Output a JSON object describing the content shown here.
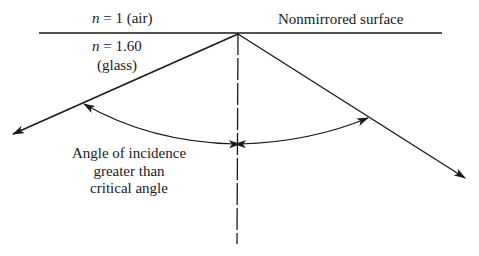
{
  "diagram": {
    "type": "total-internal-reflection",
    "labels": {
      "upper_medium_n": "n",
      "upper_medium_value": " = 1 (air)",
      "lower_medium_n": "n",
      "lower_medium_value": " = 1.60",
      "lower_medium_name": "(glass)",
      "surface": "Nonmirrored surface",
      "angle_line1": "Angle of incidence",
      "angle_line2": "greater than",
      "angle_line3": "critical angle"
    },
    "colors": {
      "line": "#1a1a1a",
      "background": "#ffffff"
    }
  }
}
